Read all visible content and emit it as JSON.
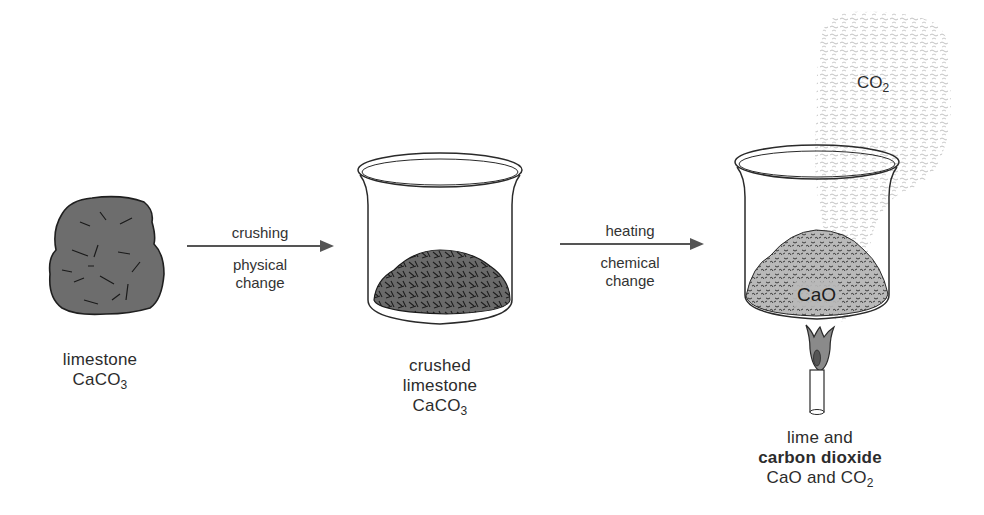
{
  "diagram": {
    "stages": [
      {
        "id": "limestone",
        "name": "limestone",
        "formula_main": "CaCO",
        "formula_sub": "3"
      },
      {
        "id": "crushed",
        "name_line1": "crushed",
        "name_line2": "limestone",
        "formula_main": "CaCO",
        "formula_sub": "3"
      },
      {
        "id": "lime",
        "name_line1": "lime and",
        "name_line2": "carbon dioxide",
        "formula_a": "CaO and CO",
        "formula_sub": "2"
      }
    ],
    "arrows": [
      {
        "id": "crushing",
        "above": "crushing",
        "below_line1": "physical",
        "below_line2": "change"
      },
      {
        "id": "heating",
        "above": "heating",
        "below_line1": "chemical",
        "below_line2": "change"
      }
    ],
    "beaker_contents_label": "CaO",
    "gas": {
      "main": "CO",
      "sub": "2"
    },
    "colors": {
      "rock_fill": "#6d6d6d",
      "crushed_fill": "#6a6a6a",
      "lime_fill": "#b9b9b9",
      "gas_fill": "#d9d9d9",
      "line": "#2a2a2a",
      "arrow": "#555555"
    }
  }
}
